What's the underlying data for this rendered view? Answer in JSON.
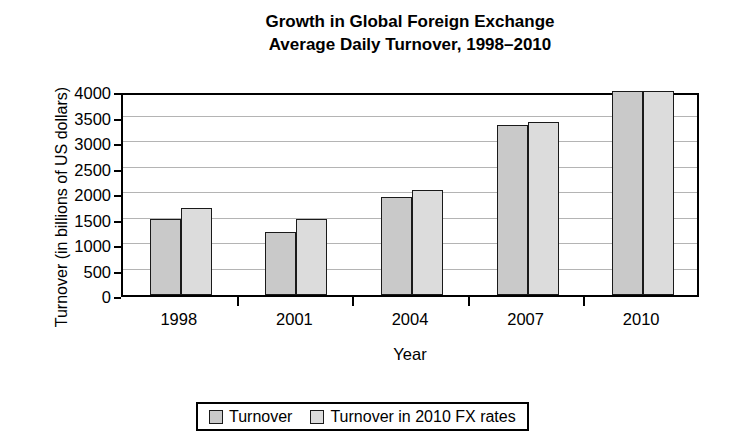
{
  "chart_data": {
    "type": "bar",
    "title": "Growth in Global Foreign Exchange Average Daily Turnover, 1998–2010",
    "title_lines": [
      "Growth in Global Foreign Exchange",
      "Average Daily Turnover, 1998–2010"
    ],
    "xlabel": "Year",
    "ylabel": "Turnover (in billions of US dollars)",
    "categories": [
      "1998",
      "2001",
      "2004",
      "2007",
      "2010"
    ],
    "series": [
      {
        "name": "Turnover",
        "color": "#c9c9c9",
        "values": [
          1500,
          1240,
          1930,
          3330,
          4000
        ]
      },
      {
        "name": "Turnover in 2010 FX rates",
        "color": "#dcdcdc",
        "values": [
          1700,
          1500,
          2050,
          3400,
          4000
        ]
      }
    ],
    "ylim": [
      0,
      4000
    ],
    "yticks": [
      0,
      500,
      1000,
      1500,
      2000,
      2500,
      3000,
      3500,
      4000
    ],
    "ytick_labels": [
      "0",
      "500",
      "1000",
      "1500",
      "2000",
      "2500",
      "3000",
      "3500",
      "4000"
    ],
    "grid": true,
    "legend_position": "bottom"
  },
  "legend": {
    "items": [
      {
        "label": "Turnover",
        "swatch": "series-0-swatch"
      },
      {
        "label": "Turnover in 2010 FX rates",
        "swatch": "series-1-swatch"
      }
    ]
  }
}
